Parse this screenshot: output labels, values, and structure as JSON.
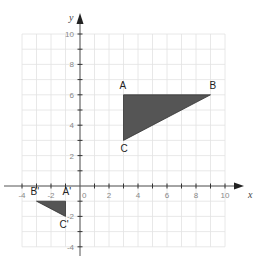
{
  "chart_data": {
    "type": "scatter",
    "title": "",
    "xlabel": "x",
    "ylabel": "y",
    "xlim": [
      -4,
      10
    ],
    "ylim": [
      -4,
      10
    ],
    "grid": true,
    "x_tick_labels": [
      "-4",
      "-2",
      "0",
      "2",
      "4",
      "6",
      "8",
      "10"
    ],
    "y_tick_labels": [
      "-4",
      "-2",
      "2",
      "4",
      "6",
      "8",
      "10"
    ],
    "origin_label": "0",
    "shapes": [
      {
        "name": "triangle ABC",
        "fill": "#555555",
        "vertices": [
          {
            "label": "A",
            "x": 3,
            "y": 6
          },
          {
            "label": "B",
            "x": 9,
            "y": 6
          },
          {
            "label": "C",
            "x": 3,
            "y": 3
          }
        ]
      },
      {
        "name": "triangle A'B'C'",
        "fill": "#555555",
        "vertices": [
          {
            "label": "A'",
            "x": -1,
            "y": -1
          },
          {
            "label": "B'",
            "x": -3,
            "y": -1
          },
          {
            "label": "C'",
            "x": -1,
            "y": -2
          }
        ]
      }
    ]
  },
  "colors": {
    "grid": "#e2e2e2",
    "axis": "#555555",
    "triangle_fill": "#555555"
  },
  "labels": {
    "x_axis": "x",
    "y_axis": "y",
    "origin": "0",
    "A": "A",
    "B": "B",
    "C": "C",
    "A_prime": "A'",
    "B_prime": "B'",
    "C_prime": "C'"
  }
}
